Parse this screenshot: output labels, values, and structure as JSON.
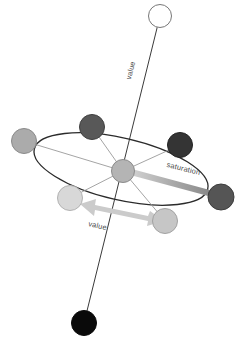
{
  "diagram": {
    "background_color": "#ffffff",
    "labels": {
      "value_axis": "value",
      "value_spread": "value",
      "saturation": "saturation"
    },
    "axes": [
      {
        "name": "value-axis",
        "label": "value",
        "from_label": "white",
        "to_label": "black",
        "from": {
          "x": 160,
          "y": 16
        },
        "to": {
          "x": 84,
          "y": 323
        },
        "stroke": "#3a3a3a",
        "stroke_width": 1
      },
      {
        "name": "saturation-axis",
        "label": "saturation",
        "from": {
          "x": 130,
          "y": 172
        },
        "to": {
          "x": 209,
          "y": 193
        },
        "stroke_start": "#c9c9c9",
        "stroke_end": "#8e8e8e",
        "stroke_width": 6
      }
    ],
    "hue_ellipse": {
      "name": "hue-ellipse",
      "cx": 121,
      "cy": 169,
      "rx": 89,
      "ry": 31,
      "rotation_deg": 13,
      "stroke": "#2b2b2b",
      "stroke_width": 1.2,
      "fill": "none"
    },
    "spread_arrow": {
      "name": "value-spread-arrow",
      "from": {
        "x": 82,
        "y": 206
      },
      "to": {
        "x": 152,
        "y": 221
      },
      "color": "#cccccc",
      "double_headed": true
    },
    "nodes": [
      {
        "name": "node-white-top",
        "role": "value-max",
        "cx": 160,
        "cy": 16,
        "r": 11.5,
        "fill": "#ffffff",
        "stroke": "#777777",
        "value_level": "white"
      },
      {
        "name": "node-black-bottom",
        "role": "value-min",
        "cx": 84,
        "cy": 323,
        "r": 12.5,
        "fill": "#0a0a0a",
        "stroke": "#0a0a0a",
        "value_level": "black"
      },
      {
        "name": "node-center",
        "role": "axis-center",
        "cx": 123,
        "cy": 171,
        "r": 11.5,
        "fill": "#b4b4b4",
        "stroke": "#8c8c8c",
        "value_level": "mid-gray"
      },
      {
        "name": "node-hue-top",
        "role": "hue-sample",
        "cx": 92,
        "cy": 127,
        "r": 12.5,
        "fill": "#585858",
        "stroke": "#3f3f3f",
        "value_level": "dark-gray"
      },
      {
        "name": "node-hue-upper-right",
        "role": "hue-sample",
        "cx": 180,
        "cy": 145,
        "r": 12.5,
        "fill": "#343434",
        "stroke": "#232323",
        "value_level": "very-dark-gray"
      },
      {
        "name": "node-hue-right",
        "role": "hue-sample",
        "cx": 221,
        "cy": 197,
        "r": 13.0,
        "fill": "#555555",
        "stroke": "#3d3d3d",
        "value_level": "dark-gray"
      },
      {
        "name": "node-hue-lower-right",
        "role": "hue-sample",
        "cx": 165,
        "cy": 221,
        "r": 12.5,
        "fill": "#c6c6c6",
        "stroke": "#a2a2a2",
        "value_level": "light-gray"
      },
      {
        "name": "node-hue-lower-left",
        "role": "hue-sample",
        "cx": 70,
        "cy": 198,
        "r": 12.5,
        "fill": "#d8d8d8",
        "stroke": "#b2b2b2",
        "value_level": "very-light-gray"
      },
      {
        "name": "node-hue-left",
        "role": "hue-sample",
        "cx": 24,
        "cy": 141,
        "r": 12.5,
        "fill": "#ababab",
        "stroke": "#8a8a8a",
        "value_level": "mid-light-gray"
      }
    ],
    "spokes": [
      {
        "name": "spoke-to-hue-top",
        "to": {
          "x": 92,
          "y": 127
        }
      },
      {
        "name": "spoke-to-hue-upper-right",
        "to": {
          "x": 180,
          "y": 145
        }
      },
      {
        "name": "spoke-to-hue-right",
        "to": {
          "x": 221,
          "y": 197
        }
      },
      {
        "name": "spoke-to-hue-lower-right",
        "to": {
          "x": 165,
          "y": 221
        }
      },
      {
        "name": "spoke-to-hue-lower-left",
        "to": {
          "x": 70,
          "y": 198
        }
      },
      {
        "name": "spoke-to-hue-left",
        "to": {
          "x": 24,
          "y": 141
        }
      }
    ],
    "colors": {
      "axis_stroke": "#3a3a3a",
      "ellipse_stroke": "#2b2b2b",
      "spoke_stroke": "#9a9a9a",
      "arrow_fill": "#cccccc",
      "label_fill": "#4a4a4a",
      "saturation_bar_light": "#c9c9c9",
      "saturation_bar_dark": "#8e8e8e"
    }
  }
}
